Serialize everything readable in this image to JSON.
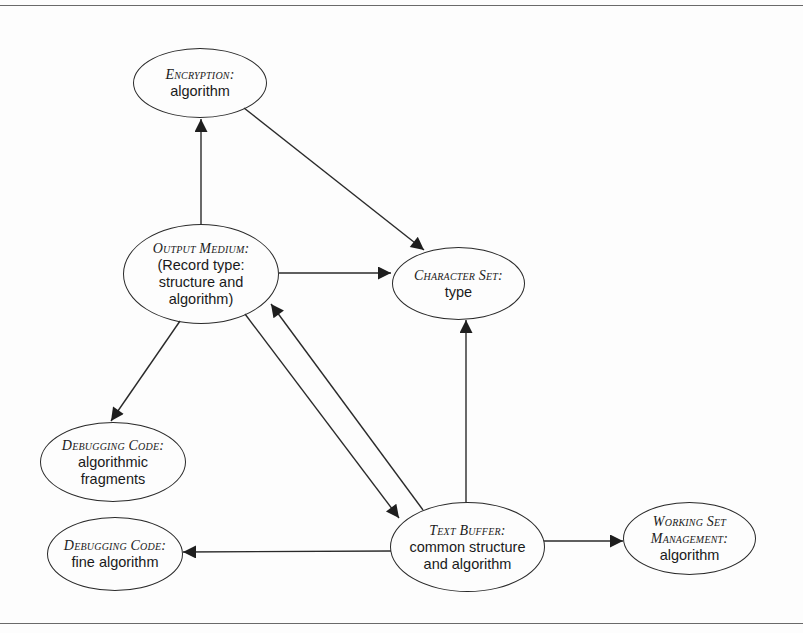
{
  "diagram": {
    "nodes": [
      {
        "id": "encryption",
        "title": "Encryption:",
        "body": [
          "algorithm"
        ]
      },
      {
        "id": "output-medium",
        "title": "Output Medium:",
        "body": [
          "(Record type:",
          "structure and",
          "algorithm)"
        ]
      },
      {
        "id": "character-set",
        "title": "Character Set:",
        "body": [
          "type"
        ]
      },
      {
        "id": "debugging-code-fragments",
        "title": "Debugging Code:",
        "body": [
          "algorithmic",
          "fragments"
        ]
      },
      {
        "id": "debugging-code-fine",
        "title": "Debugging Code:",
        "body": [
          "fine algorithm"
        ]
      },
      {
        "id": "text-buffer",
        "title": "Text Buffer:",
        "body": [
          "common structure",
          "and algorithm"
        ]
      },
      {
        "id": "working-set",
        "title": [
          "Working Set",
          "Management:"
        ],
        "body": [
          "algorithm"
        ]
      }
    ],
    "edges": [
      {
        "from": "output-medium",
        "to": "encryption"
      },
      {
        "from": "encryption",
        "to": "character-set"
      },
      {
        "from": "output-medium",
        "to": "character-set"
      },
      {
        "from": "output-medium",
        "to": "debugging-code-fragments"
      },
      {
        "from": "output-medium",
        "to": "text-buffer"
      },
      {
        "from": "text-buffer",
        "to": "output-medium"
      },
      {
        "from": "text-buffer",
        "to": "character-set"
      },
      {
        "from": "text-buffer",
        "to": "debugging-code-fine"
      },
      {
        "from": "text-buffer",
        "to": "working-set"
      }
    ],
    "colors": {
      "stroke": "#2a2a2a",
      "background": "#fdfdfd",
      "rule": "#6a6a6a"
    }
  }
}
